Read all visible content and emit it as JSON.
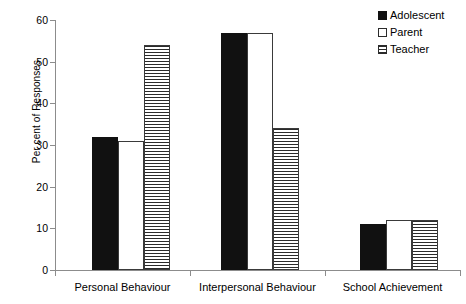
{
  "chart_data": {
    "type": "bar",
    "title": "",
    "xlabel": "",
    "ylabel": "Per cent of Responses",
    "ylim": [
      0,
      60
    ],
    "yticks": [
      0,
      10,
      20,
      30,
      40,
      50,
      60
    ],
    "ytick_labels": [
      "0",
      "10",
      "20",
      "30",
      "40",
      "50",
      "60"
    ],
    "grid": false,
    "legend_position": "top-right",
    "categories": [
      "Personal Behaviour",
      "Interpersonal Behaviour",
      "School Achievement"
    ],
    "series": [
      {
        "name": "Adolescent",
        "fill": "solid-black",
        "color": "#111111",
        "values": [
          32,
          57,
          11
        ]
      },
      {
        "name": "Parent",
        "fill": "white",
        "color": "#ffffff",
        "values": [
          31,
          57,
          12
        ]
      },
      {
        "name": "Teacher",
        "fill": "horizontal-stripes",
        "color": "#2b2b2b",
        "values": [
          54,
          34,
          12
        ]
      }
    ]
  },
  "legend": {
    "items": [
      {
        "label": "Adolescent"
      },
      {
        "label": "Parent"
      },
      {
        "label": "Teacher"
      }
    ]
  }
}
